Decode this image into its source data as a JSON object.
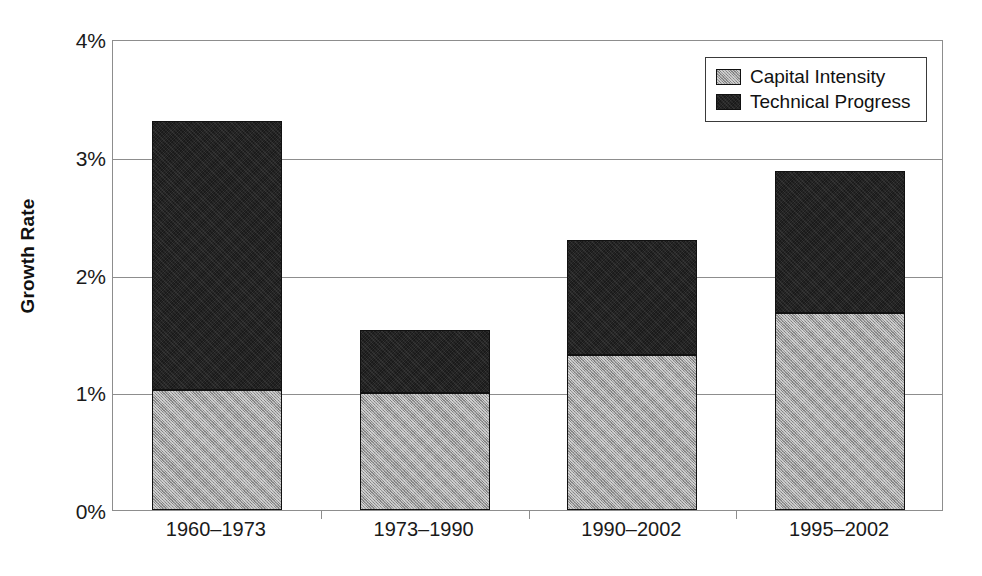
{
  "chart_data": {
    "type": "bar",
    "subtype": "stacked-bar",
    "title": "",
    "xlabel": "",
    "ylabel": "Growth Rate",
    "categories": [
      "1960–1973",
      "1973–1990",
      "1990–2002",
      "1995–2002"
    ],
    "series": [
      {
        "name": "Capital Intensity",
        "color": "#9a9a9a",
        "values": [
          1.02,
          0.99,
          1.32,
          1.67
        ]
      },
      {
        "name": "Technical Progress",
        "color": "#1a1a1a",
        "values": [
          2.28,
          0.54,
          0.97,
          1.21
        ]
      }
    ],
    "totals": [
      3.3,
      1.53,
      2.29,
      2.88
    ],
    "ylim": [
      0,
      4
    ],
    "yticks": [
      0,
      1,
      2,
      3,
      4
    ],
    "ytick_labels": [
      "0%",
      "1%",
      "2%",
      "3%",
      "4%"
    ],
    "grid": true,
    "grid_axis": "y",
    "legend_position": "top-right",
    "units": "percent"
  },
  "axes": {
    "y_title": "Growth Rate",
    "y_ticks": [
      {
        "label": "4%",
        "value": 4
      },
      {
        "label": "3%",
        "value": 3
      },
      {
        "label": "2%",
        "value": 2
      },
      {
        "label": "1%",
        "value": 1
      },
      {
        "label": "0%",
        "value": 0
      }
    ],
    "x_ticks": [
      {
        "label": "1960–1973"
      },
      {
        "label": "1973–1990"
      },
      {
        "label": "1990–2002"
      },
      {
        "label": "1995–2002"
      }
    ]
  },
  "legend": {
    "entries": [
      {
        "label": "Capital Intensity",
        "color": "#9a9a9a"
      },
      {
        "label": "Technical Progress",
        "color": "#1a1a1a"
      }
    ]
  },
  "style": {
    "background": "#ffffff",
    "axis_color": "#8d8d8d",
    "text_color": "#1a1a1a",
    "gray_series": "#9a9a9a",
    "black_series": "#1a1a1a"
  }
}
